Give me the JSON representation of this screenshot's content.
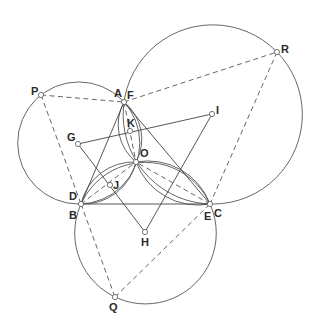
{
  "diagram": {
    "type": "geometry-construction",
    "points": [
      {
        "id": "A",
        "label": "A"
      },
      {
        "id": "F",
        "label": "F"
      },
      {
        "id": "B",
        "label": "B"
      },
      {
        "id": "D",
        "label": "D"
      },
      {
        "id": "C",
        "label": "C"
      },
      {
        "id": "E",
        "label": "E"
      },
      {
        "id": "P",
        "label": "P"
      },
      {
        "id": "Q",
        "label": "Q"
      },
      {
        "id": "R",
        "label": "R"
      },
      {
        "id": "G",
        "label": "G"
      },
      {
        "id": "H",
        "label": "H"
      },
      {
        "id": "I",
        "label": "I"
      },
      {
        "id": "K",
        "label": "K"
      },
      {
        "id": "O",
        "label": "O"
      },
      {
        "id": "J",
        "label": "J"
      }
    ],
    "coincident_points": [
      [
        "A",
        "F"
      ],
      [
        "B",
        "D"
      ],
      [
        "C",
        "E"
      ]
    ],
    "solid_segments": [
      [
        "A",
        "B"
      ],
      [
        "A",
        "C"
      ],
      [
        "B",
        "C"
      ],
      [
        "G",
        "I"
      ],
      [
        "G",
        "H"
      ],
      [
        "H",
        "I"
      ]
    ],
    "dashed_segments": [
      [
        "P",
        "F"
      ],
      [
        "F",
        "R"
      ],
      [
        "P",
        "D"
      ],
      [
        "R",
        "E"
      ],
      [
        "D",
        "Q"
      ],
      [
        "Q",
        "E"
      ],
      [
        "A",
        "O"
      ],
      [
        "B",
        "O"
      ],
      [
        "C",
        "O"
      ]
    ],
    "circles": [
      {
        "name": "circle-ABP",
        "through": [
          "A",
          "B",
          "P"
        ]
      },
      {
        "name": "circle-ACR",
        "through": [
          "A",
          "C",
          "R"
        ]
      },
      {
        "name": "circle-BCQ",
        "through": [
          "B",
          "C",
          "Q"
        ]
      }
    ],
    "lenses": [
      {
        "name": "lens-AO",
        "between": [
          "A",
          "O"
        ],
        "contains": "K"
      },
      {
        "name": "lens-BO",
        "between": [
          "B",
          "O"
        ],
        "contains": "J"
      },
      {
        "name": "lens-CO",
        "between": [
          "C",
          "O"
        ]
      }
    ]
  }
}
